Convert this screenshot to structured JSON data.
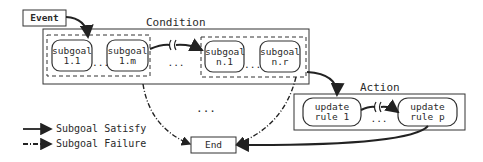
{
  "event": {
    "label": "Event"
  },
  "condition": {
    "title": "Condition",
    "groups": [
      {
        "subgoals": [
          {
            "line1": "subgoal",
            "line2": "1.1"
          },
          {
            "line1": "subgoal",
            "line2": "1.m"
          }
        ],
        "ellipsis": "..."
      },
      {
        "subgoals": [
          {
            "line1": "subgoal",
            "line2": "n.1"
          },
          {
            "line1": "subgoal",
            "line2": "n.r"
          }
        ],
        "ellipsis": "..."
      }
    ],
    "between_ellipsis": "..."
  },
  "action": {
    "title": "Action",
    "rules": [
      {
        "line1": "update",
        "line2": "rule 1"
      },
      {
        "line1": "update",
        "line2": "rule p"
      }
    ],
    "ellipsis": "..."
  },
  "middle_ellipsis": "...",
  "end": {
    "label": "End"
  },
  "legend": [
    {
      "label": "Subgoal Satisfy",
      "style": "solid"
    },
    {
      "label": "Subgoal Failure",
      "style": "dash-dot"
    }
  ]
}
